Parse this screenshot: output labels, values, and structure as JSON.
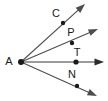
{
  "figure": {
    "kind": "geometry-angle-diagram",
    "width": 108,
    "height": 101,
    "background_color": "#FFFFFF",
    "vertex": {
      "label": "A",
      "x": 21,
      "y": 62,
      "label_x": 9,
      "label_y": 62,
      "dot_radius": 3.0,
      "dot_color": "#1A1A1A"
    },
    "rays": [
      {
        "name": "ray-AC",
        "point_label": "C",
        "point_x": 63,
        "point_y": 23,
        "label_x": 56,
        "label_y": 14,
        "tip_x": 85,
        "tip_y": 4,
        "color": "#4D4D4D",
        "stroke_width": 1.1,
        "dot_radius": 2.2,
        "dot_color": "#1A1A1A"
      },
      {
        "name": "ray-AP",
        "point_label": "P",
        "point_x": 72,
        "point_y": 43,
        "label_x": 71,
        "label_y": 33,
        "tip_x": 98,
        "tip_y": 29,
        "color": "#4D4D4D",
        "stroke_width": 1.1,
        "dot_radius": 2.2,
        "dot_color": "#1A1A1A"
      },
      {
        "name": "ray-AT",
        "point_label": "T",
        "point_x": 76,
        "point_y": 62,
        "label_x": 77,
        "label_y": 53,
        "tip_x": 104,
        "tip_y": 62,
        "color": "#9B9B9B",
        "stroke_width": 2.0,
        "dot_radius": 2.6,
        "dot_color": "#1A1A1A"
      },
      {
        "name": "ray-AN",
        "point_label": "N",
        "point_x": 77,
        "point_y": 86,
        "label_x": 72,
        "label_y": 75,
        "tip_x": 97,
        "tip_y": 96,
        "color": "#4D4D4D",
        "stroke_width": 1.1,
        "dot_radius": 2.2,
        "dot_color": "#1A1A1A"
      }
    ],
    "labels": {
      "vertex": "A",
      "c": "C",
      "p": "P",
      "t": "T",
      "n": "N"
    }
  }
}
